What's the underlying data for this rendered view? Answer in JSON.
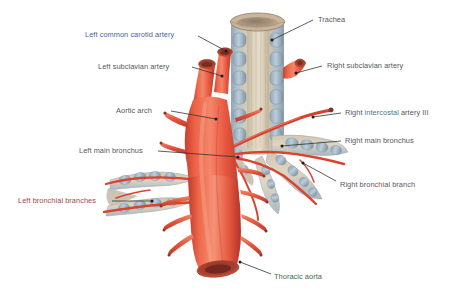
{
  "figure": {
    "background_color": "#ffffff",
    "width": 453,
    "height": 295
  },
  "palette": {
    "aorta_red": "#e8563c",
    "aorta_red_light": "#f0795c",
    "aorta_red_dark": "#b8352a",
    "lumen_dark": "#8c3328",
    "cartilage_blue": "#a9bccb",
    "cartilage_blue_dark": "#7e94a6",
    "mucosa_tan": "#cdbfa8",
    "mucosa_tan_light": "#ded3bf",
    "leader_line": "#333333",
    "text_gray": "#55585c",
    "text_blue": "#4a5f9e",
    "text_red": "#a8453f",
    "text_green": "#3f6b4a",
    "text_teal": "#3d7a92"
  },
  "labels": [
    {
      "id": "left-common-carotid-artery",
      "text": "Left common carotid artery",
      "segments": [
        {
          "t": "Left common ",
          "c": "seg-blue"
        },
        {
          "t": "carotid artery",
          "c": "seg-blue"
        }
      ],
      "x": 85,
      "y": 30,
      "align": "left",
      "leader": {
        "x1": 198,
        "y1": 36,
        "x2": 226,
        "y2": 51
      }
    },
    {
      "id": "left-subclavian-artery",
      "text": "Left subclavian artery",
      "segments": [
        {
          "t": "Left subclavian artery",
          "c": "seg-gray"
        }
      ],
      "x": 98,
      "y": 62,
      "align": "left",
      "leader": {
        "x1": 192,
        "y1": 67,
        "x2": 222,
        "y2": 76
      }
    },
    {
      "id": "trachea",
      "text": "Trachea",
      "segments": [
        {
          "t": "Trachea",
          "c": "seg-gray"
        }
      ],
      "x": 318,
      "y": 15,
      "align": "left",
      "leader": {
        "x1": 313,
        "y1": 20,
        "x2": 272,
        "y2": 40
      }
    },
    {
      "id": "right-subclavian-artery",
      "text": "Right subclavian artery",
      "segments": [
        {
          "t": "Right subclavian artery",
          "c": "seg-gray"
        }
      ],
      "x": 327,
      "y": 61,
      "align": "left",
      "leader": {
        "x1": 322,
        "y1": 66,
        "x2": 296,
        "y2": 73
      }
    },
    {
      "id": "aortic-arch",
      "text": "Aortic arch",
      "segments": [
        {
          "t": "Aortic arch",
          "c": "seg-gray"
        }
      ],
      "x": 116,
      "y": 106,
      "align": "left",
      "leader": {
        "x1": 171,
        "y1": 111,
        "x2": 216,
        "y2": 119
      }
    },
    {
      "id": "right-intercostal-artery-iii",
      "text": "Right intercostal artery III",
      "segments": [
        {
          "t": "Right ",
          "c": "seg-gray"
        },
        {
          "t": "intercostal",
          "c": "seg-teal"
        },
        {
          "t": " artery III",
          "c": "seg-gray"
        }
      ],
      "x": 345,
      "y": 108,
      "align": "left",
      "leader": {
        "x1": 341,
        "y1": 113,
        "x2": 313,
        "y2": 117
      }
    },
    {
      "id": "right-main-bronchus",
      "text": "Right main bronchus",
      "segments": [
        {
          "t": "Right main bronchus",
          "c": "seg-gray"
        }
      ],
      "x": 345,
      "y": 136,
      "align": "left",
      "leader": {
        "x1": 341,
        "y1": 141,
        "x2": 282,
        "y2": 146
      }
    },
    {
      "id": "left-main-bronchus",
      "text": "Left main bronchus",
      "segments": [
        {
          "t": "Left main bronchus",
          "c": "seg-gray"
        }
      ],
      "x": 79,
      "y": 146,
      "align": "left",
      "leader": {
        "x1": 158,
        "y1": 151,
        "x2": 238,
        "y2": 157
      }
    },
    {
      "id": "right-bronchial-branch",
      "text": "Right bronchial branch",
      "segments": [
        {
          "t": "Right bron",
          "c": "seg-gray"
        },
        {
          "t": "chi",
          "c": "seg-red"
        },
        {
          "t": "al branch",
          "c": "seg-gray"
        }
      ],
      "x": 340,
      "y": 180,
      "align": "left",
      "leader": {
        "x1": 336,
        "y1": 181,
        "x2": 303,
        "y2": 163
      }
    },
    {
      "id": "left-bronchial-branches",
      "text": "Left bronchial branches",
      "segments": [
        {
          "t": "Left bronchial branches",
          "c": "seg-red"
        }
      ],
      "x": 18,
      "y": 196,
      "align": "left",
      "leader": {
        "x1": 112,
        "y1": 201,
        "x2": 152,
        "y2": 201
      }
    },
    {
      "id": "thoracic-aorta",
      "text": "Thoracic aorta",
      "segments": [
        {
          "t": "Thoracic aorta",
          "c": "seg-green"
        }
      ],
      "x": 274,
      "y": 272,
      "align": "left",
      "leader": {
        "x1": 271,
        "y1": 274,
        "x2": 240,
        "y2": 262
      }
    }
  ],
  "structures": [
    {
      "id": "trachea",
      "name": "Trachea",
      "kind": "airway"
    },
    {
      "id": "right-main-bronchus",
      "name": "Right main bronchus",
      "kind": "airway"
    },
    {
      "id": "left-main-bronchus",
      "name": "Left main bronchus",
      "kind": "airway"
    },
    {
      "id": "aortic-arch",
      "name": "Aortic arch",
      "kind": "artery"
    },
    {
      "id": "thoracic-aorta",
      "name": "Thoracic aorta",
      "kind": "artery"
    },
    {
      "id": "left-common-carotid-artery",
      "name": "Left common carotid artery",
      "kind": "artery"
    },
    {
      "id": "left-subclavian-artery",
      "name": "Left subclavian artery",
      "kind": "artery"
    },
    {
      "id": "right-subclavian-artery",
      "name": "Right subclavian artery",
      "kind": "artery"
    },
    {
      "id": "right-intercostal-artery-iii",
      "name": "Right intercostal artery III",
      "kind": "artery"
    },
    {
      "id": "right-bronchial-branch",
      "name": "Right bronchial branch",
      "kind": "artery"
    },
    {
      "id": "left-bronchial-branches",
      "name": "Left bronchial branches",
      "kind": "artery"
    }
  ]
}
